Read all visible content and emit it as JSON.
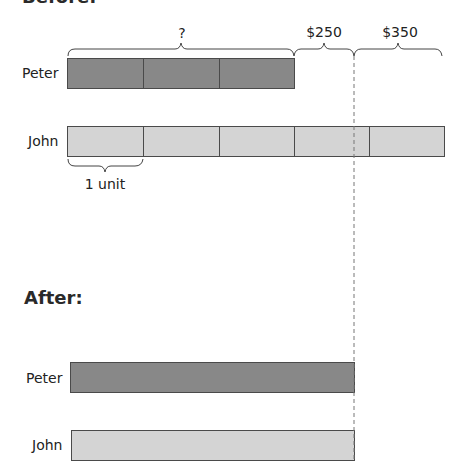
{
  "headings": {
    "before": "Before:",
    "after": "After:"
  },
  "before": {
    "peter": {
      "label": "Peter",
      "units": 3,
      "color": "#888888"
    },
    "john": {
      "label": "John",
      "units": 5,
      "color": "#d4d4d4"
    },
    "braces": {
      "unknown": "?",
      "amount1": "$250",
      "amount2": "$350",
      "unit": "1 unit"
    }
  },
  "after": {
    "peter": {
      "label": "Peter",
      "color": "#888888"
    },
    "john": {
      "label": "John",
      "color": "#d4d4d4"
    }
  }
}
